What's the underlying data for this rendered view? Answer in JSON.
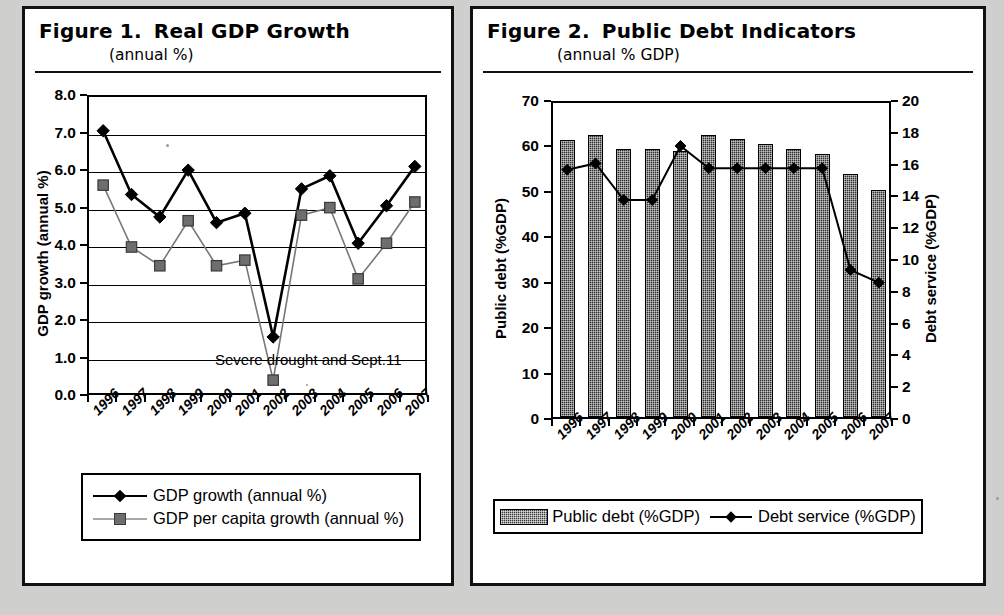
{
  "figure1": {
    "title_number": "Figure 1.",
    "title_text": "Real GDP Growth",
    "subtitle": "(annual %)",
    "y_axis_title": "GDP growth (annual %)",
    "annotation": "Severe drought and Sept.11",
    "legend": [
      {
        "label": "GDP growth (annual %)",
        "symbol": "diamond"
      },
      {
        "label": "GDP per capita growth (annual %)",
        "symbol": "square"
      }
    ],
    "y_ticks": [
      "0.0",
      "1.0",
      "2.0",
      "3.0",
      "4.0",
      "5.0",
      "6.0",
      "7.0",
      "8.0"
    ]
  },
  "figure2": {
    "title_number": "Figure 2.",
    "title_text": "Public Debt Indicators",
    "subtitle": "(annual % GDP)",
    "y_axis_title_left": "Public debt (%GDP)",
    "y_axis_title_right": "Debt service (%GDP)",
    "legend": [
      {
        "label": "Public debt (%GDP)",
        "symbol": "bar-swatch"
      },
      {
        "label": "Debt service (%GDP)",
        "symbol": "diamond"
      }
    ],
    "y_ticks_left": [
      "0",
      "10",
      "20",
      "30",
      "40",
      "50",
      "60",
      "70"
    ],
    "y_ticks_right": [
      "0",
      "2",
      "4",
      "6",
      "8",
      "10",
      "12",
      "14",
      "16",
      "18",
      "20"
    ]
  },
  "colors": {
    "ink": "#000000",
    "bar_fill": "#2e2e2e",
    "secondary_line": "#777777",
    "secondary_marker": "#6e6e6e",
    "paper": "#ffffff",
    "page_background": "#cfcfcd"
  },
  "chart_data": [
    {
      "type": "line",
      "title": "Figure 1. Real GDP Growth (annual %)",
      "xlabel": "",
      "ylabel": "GDP growth (annual %)",
      "ylim": [
        0,
        8
      ],
      "ytick_step": 1,
      "grid": true,
      "legend_position": "below-plot",
      "annotations": [
        {
          "text": "Severe drought and Sept.11",
          "near_x": "2003",
          "near_y": 0.75
        }
      ],
      "categories": [
        "1996",
        "1997",
        "1998",
        "1999",
        "2000",
        "2001",
        "2002",
        "2003",
        "2004",
        "2005",
        "2006",
        "2007"
      ],
      "series": [
        {
          "name": "GDP growth (annual %)",
          "marker": "diamond",
          "values": [
            7.1,
            5.4,
            4.8,
            6.05,
            4.65,
            4.9,
            1.6,
            5.55,
            5.9,
            4.1,
            5.1,
            6.15
          ]
        },
        {
          "name": "GDP per capita growth (annual %)",
          "marker": "square",
          "values": [
            5.65,
            4.0,
            3.5,
            4.7,
            3.5,
            3.65,
            0.45,
            4.85,
            5.05,
            3.15,
            4.1,
            5.2
          ]
        }
      ]
    },
    {
      "type": "bar",
      "title": "Figure 2. Public Debt Indicators (annual % GDP)",
      "xlabel": "",
      "ylabel": "Public debt (%GDP)",
      "y2label": "Debt service (%GDP)",
      "ylim": [
        0,
        70
      ],
      "ytick_step": 10,
      "y2lim": [
        0,
        20
      ],
      "y2tick_step": 2,
      "grid": false,
      "legend_position": "below-plot",
      "categories": [
        "1996",
        "1997",
        "1998",
        "1999",
        "2000",
        "2001",
        "2002",
        "2003",
        "2004",
        "2005",
        "2006",
        "2007"
      ],
      "series": [
        {
          "name": "Public debt (%GDP)",
          "kind": "bar",
          "axis": "left",
          "values": [
            61,
            62,
            59,
            59,
            58.5,
            62,
            61.2,
            60,
            59,
            58,
            53.5,
            50
          ]
        },
        {
          "name": "Debt service (%GDP)",
          "kind": "line",
          "axis": "right",
          "marker": "diamond",
          "values": [
            15.8,
            16.2,
            13.9,
            13.9,
            17.3,
            15.9,
            15.9,
            15.9,
            15.9,
            15.9,
            9.5,
            8.7
          ]
        }
      ]
    }
  ]
}
